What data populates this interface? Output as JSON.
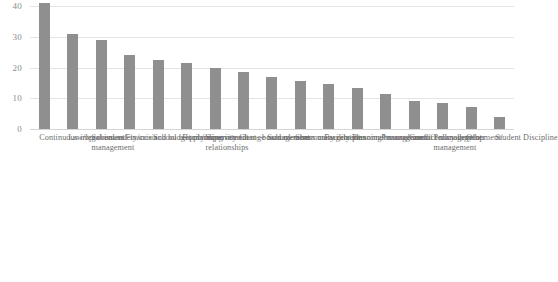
{
  "chart_data": {
    "type": "bar",
    "title": "",
    "subtitle": "",
    "xlabel": "",
    "ylabel": "",
    "ylim": [
      0,
      40
    ],
    "yticks": [
      0,
      10,
      20,
      30,
      40
    ],
    "grid": true,
    "legend": "none",
    "orientation": "vertical",
    "bar_color": "#8f8f8f",
    "gridline_color": "#e4e4e4",
    "axis_text_color": "#8c8c8c",
    "label_rotation_degrees": 90,
    "categories": [
      "Continuous improvement",
      "Law/legal issues",
      "School safety/crisis management",
      "Finance and budget planning",
      "School reform/improvement",
      "Equity/diversity",
      "Superintendent--board member relationships",
      "Change management",
      "School--community relations",
      "Stress management",
      "Facility planning/management",
      "Personnel management",
      "Personal use of technology",
      "Conflict management",
      "Policy development/management",
      "Other",
      "Student Discipline"
    ],
    "category_lines": [
      [
        "Continuous improvement"
      ],
      [
        "Law/legal issues"
      ],
      [
        "School safety/crisis",
        "management"
      ],
      [
        "Finance and budget planning"
      ],
      [
        "School reform/improvement"
      ],
      [
        "Equity/diversity"
      ],
      [
        "Superintendent--board member",
        "relationships"
      ],
      [
        "Change management"
      ],
      [
        "School--community relations"
      ],
      [
        "Stress management"
      ],
      [
        "Facility planning/management"
      ],
      [
        "Personnel management"
      ],
      [
        "Personal use of technology"
      ],
      [
        "Conflict management"
      ],
      [
        "Policy development/",
        "management"
      ],
      [
        "Other"
      ],
      [
        "Student Discipline"
      ]
    ],
    "values": [
      41,
      31,
      29,
      24,
      22.5,
      21.5,
      20,
      18.5,
      17,
      15.5,
      14.5,
      13.5,
      11.5,
      9,
      8.5,
      7,
      4
    ]
  }
}
